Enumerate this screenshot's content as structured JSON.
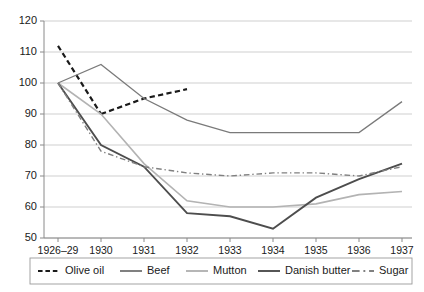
{
  "chart_data": {
    "type": "line",
    "title": "",
    "subtitle": "",
    "xlabel": "",
    "ylabel": "",
    "categories": [
      "1926–29",
      "1930",
      "1931",
      "1932",
      "1933",
      "1934",
      "1935",
      "1936",
      "1937"
    ],
    "yticks": [
      50,
      60,
      70,
      80,
      90,
      100,
      110,
      120
    ],
    "ylim": [
      50,
      120
    ],
    "grid": "horizontal",
    "legend_position": "bottom",
    "series": [
      {
        "name": "Olive oil",
        "style": "dashed",
        "color": "#1a1a1a",
        "width": 2.2,
        "segments": [
          {
            "x": [
              "1926–29",
              "1930"
            ],
            "values": [
              112,
              90
            ]
          },
          {
            "x": [
              "1930",
              "1931",
              "1932"
            ],
            "values": [
              90,
              95,
              98
            ]
          },
          {
            "x": [
              "1932"
            ],
            "values": [
              98
            ]
          }
        ],
        "values": [
          112,
          90,
          95,
          98,
          null,
          null,
          null,
          null,
          null
        ]
      },
      {
        "name": "Beef",
        "style": "solid",
        "color": "#7a7a7a",
        "width": 1.3,
        "values": [
          100,
          106,
          95,
          88,
          84,
          84,
          84,
          84,
          94
        ]
      },
      {
        "name": "Mutton",
        "style": "solid",
        "color": "#b3b3b3",
        "width": 1.6,
        "values": [
          100,
          90,
          74,
          62,
          60,
          60,
          61,
          64,
          65
        ]
      },
      {
        "name": "Danish butter",
        "style": "solid",
        "color": "#4d4d4d",
        "width": 1.9,
        "values": [
          100,
          80,
          73,
          58,
          57,
          53,
          63,
          69,
          74
        ]
      },
      {
        "name": "Sugar",
        "style": "dashdot",
        "color": "#808080",
        "width": 1.4,
        "values": [
          100,
          78,
          73,
          71,
          70,
          71,
          71,
          70,
          73
        ]
      }
    ]
  },
  "legend": {
    "items": [
      {
        "label": "Olive oil",
        "style": "dashed",
        "color": "#1a1a1a"
      },
      {
        "label": "Beef",
        "style": "solid",
        "color": "#7a7a7a"
      },
      {
        "label": "Mutton",
        "style": "solid",
        "color": "#b3b3b3"
      },
      {
        "label": "Danish butter",
        "style": "solid",
        "color": "#4d4d4d"
      },
      {
        "label": "Sugar",
        "style": "dashdot",
        "color": "#808080"
      }
    ]
  },
  "axes": {
    "y_labels": [
      "120",
      "110",
      "100",
      "90",
      "80",
      "70",
      "60",
      "50"
    ],
    "x_labels": [
      "1926–29",
      "1930",
      "1931",
      "1932",
      "1933",
      "1934",
      "1935",
      "1936",
      "1937"
    ]
  }
}
